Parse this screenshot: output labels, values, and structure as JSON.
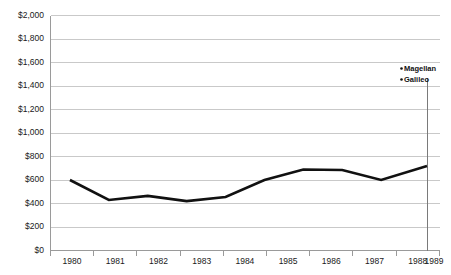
{
  "chart_data": {
    "type": "line",
    "title": "",
    "subtitle": "",
    "xlabel": "",
    "ylabel": "",
    "categories": [
      "1980",
      "1981",
      "1982",
      "1983",
      "1984",
      "1985",
      "1986",
      "1987",
      "1988",
      "1989"
    ],
    "values": [
      600,
      430,
      465,
      420,
      455,
      600,
      690,
      685,
      600,
      720
    ],
    "series": [
      {
        "name": "",
        "values": [
          600,
          430,
          465,
          420,
          455,
          600,
          690,
          685,
          600,
          720
        ]
      }
    ],
    "ylim": [
      0,
      2000
    ],
    "ytick_values": [
      0,
      200,
      400,
      600,
      800,
      1000,
      1200,
      1400,
      1600,
      1800,
      2000
    ],
    "ytick_labels": [
      "$0",
      "$200",
      "$400",
      "$600",
      "$800",
      "$1,000",
      "$1,200",
      "$1,400",
      "$1,600",
      "$1,800",
      "$2,000"
    ],
    "xtick_labels": [
      "1980",
      "1981",
      "1982",
      "1983",
      "1984",
      "1985",
      "1986",
      "1987",
      "1988",
      "1989"
    ],
    "grid": true,
    "grid_axis": "y",
    "legend": false,
    "legend_position": "none",
    "line_color": "#111111",
    "grid_color": "#c9c9c9",
    "axis_color": "#9a9a9a",
    "background_color": "#ffffff",
    "annotations": [
      {
        "label": "Magellan",
        "x_category": "1989",
        "marker": "dot"
      },
      {
        "label": "Galileo",
        "x_category": "1989",
        "marker": "dot"
      }
    ],
    "event_marker": {
      "x_category": "1989",
      "label": "",
      "color": "#7a7a7a"
    }
  }
}
